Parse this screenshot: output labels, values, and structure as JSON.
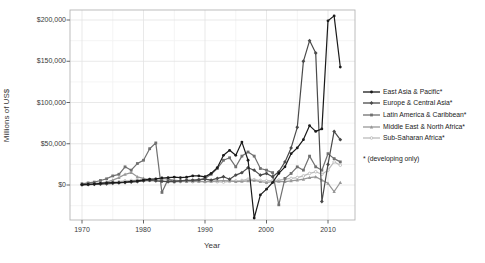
{
  "figure": {
    "y_axis_title": "Millions of US$",
    "x_axis_title": "Year",
    "footnote": "* (developing only)"
  },
  "chart_data": {
    "type": "line",
    "title": "",
    "xlabel": "Year",
    "ylabel": "Millions of US$",
    "grid": "light gray major gridlines at decades and $50,000 steps, faint minor gridlines at 5-year and $25,000 steps",
    "legend_position": "right of plot",
    "footnote": "* (developing only)",
    "xlim": [
      1968,
      2014.5
    ],
    "ylim": [
      -42000,
      212000
    ],
    "x_ticks": [
      1970,
      1980,
      1990,
      2000,
      2010
    ],
    "x_tick_labels": [
      "1970",
      "1980",
      "1990",
      "2000",
      "2010"
    ],
    "y_ticks": [
      0,
      50000,
      100000,
      150000,
      200000
    ],
    "y_tick_labels": [
      "$0",
      "$50,000",
      "$100,000",
      "$150,000",
      "$200,000"
    ],
    "x": [
      1970,
      1971,
      1972,
      1973,
      1974,
      1975,
      1976,
      1977,
      1978,
      1979,
      1980,
      1981,
      1982,
      1983,
      1984,
      1985,
      1986,
      1987,
      1988,
      1989,
      1990,
      1991,
      1992,
      1993,
      1994,
      1995,
      1996,
      1997,
      1998,
      1999,
      2000,
      2001,
      2002,
      2003,
      2004,
      2005,
      2006,
      2007,
      2008,
      2009,
      2010,
      2011,
      2012
    ],
    "series": [
      {
        "name": "East Asia & Pacific*",
        "color": "#1a1a1a",
        "marker": "circle",
        "values": [
          500,
          800,
          1200,
          2000,
          2500,
          3000,
          3000,
          3500,
          4500,
          5000,
          6000,
          7000,
          7500,
          8500,
          9000,
          9500,
          9000,
          9500,
          11000,
          11000,
          10000,
          14000,
          21000,
          36000,
          42000,
          36000,
          52000,
          30000,
          -40000,
          -12000,
          -5000,
          3000,
          14000,
          22000,
          38000,
          45000,
          55000,
          72000,
          65000,
          68000,
          199000,
          205000,
          143000
        ]
      },
      {
        "name": "Europe & Central Asia*",
        "color": "#4a4a4a",
        "marker": "diamond",
        "values": [
          300,
          500,
          800,
          1000,
          1500,
          2000,
          2500,
          3000,
          3500,
          4000,
          5000,
          5500,
          5000,
          4500,
          4000,
          4500,
          5000,
          5500,
          6000,
          6500,
          7000,
          6000,
          8000,
          10000,
          7000,
          12000,
          15000,
          21000,
          18000,
          12000,
          14000,
          10000,
          16000,
          28000,
          45000,
          70000,
          150000,
          175000,
          160000,
          -20000,
          25000,
          65000,
          55000
        ]
      },
      {
        "name": "Latin America & Caribbean*",
        "color": "#707070",
        "marker": "square",
        "values": [
          1500,
          2500,
          3500,
          5500,
          7500,
          11000,
          13000,
          22000,
          18000,
          26000,
          30000,
          44000,
          51000,
          -9000,
          7000,
          4000,
          5000,
          6000,
          5000,
          6000,
          8000,
          13000,
          20000,
          30000,
          33000,
          22000,
          35000,
          40000,
          35000,
          20000,
          18000,
          15000,
          -24000,
          8000,
          14000,
          22000,
          18000,
          35000,
          22000,
          18000,
          38000,
          32000,
          28000
        ]
      },
      {
        "name": "Middle East & North Africa*",
        "color": "#989898",
        "marker": "triangle",
        "values": [
          800,
          1200,
          1800,
          2500,
          3500,
          6000,
          9000,
          13000,
          15000,
          10000,
          8000,
          6000,
          7000,
          8000,
          7000,
          6000,
          5000,
          4000,
          5000,
          4500,
          4000,
          4500,
          5000,
          5500,
          5000,
          4000,
          4500,
          5000,
          5500,
          4000,
          3000,
          4000,
          4500,
          4000,
          5000,
          6000,
          7000,
          9000,
          10000,
          6000,
          2000,
          -8000,
          3000
        ]
      },
      {
        "name": "Sub-Saharan Africa*",
        "color": "#bcbcbc",
        "marker": "circle-open",
        "values": [
          600,
          900,
          1200,
          1800,
          2500,
          3500,
          4000,
          5000,
          5500,
          6000,
          7000,
          6500,
          6000,
          5000,
          4000,
          3500,
          4000,
          4500,
          4000,
          4500,
          4000,
          4500,
          4000,
          3500,
          4500,
          5000,
          5500,
          7000,
          6500,
          5500,
          5000,
          5500,
          6000,
          7000,
          8000,
          9000,
          11000,
          14000,
          16000,
          13000,
          18000,
          28000,
          24000
        ]
      }
    ]
  }
}
